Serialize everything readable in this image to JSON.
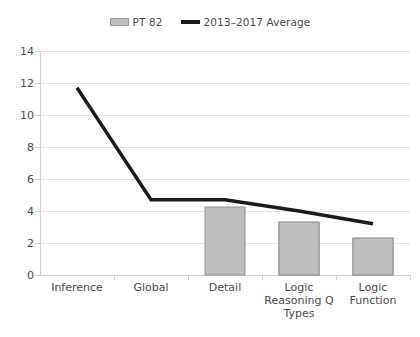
{
  "chart_data": {
    "type": "bar",
    "title": "",
    "xlabel": "",
    "ylabel": "",
    "ylim": [
      0,
      14
    ],
    "ytick_step": 2,
    "yticks": [
      "0",
      "2",
      "4",
      "6",
      "8",
      "10",
      "12",
      "14"
    ],
    "grid": true,
    "legend_position": "top-center",
    "categories": [
      "Inference",
      "Global",
      "Detail",
      "Logic Reasoning Q Types",
      "Logic Function"
    ],
    "series": [
      {
        "name": "PT 82",
        "type": "bar",
        "color": "#bebebe",
        "values": [
          12,
          6.1,
          4.25,
          3.3,
          2.3
        ]
      },
      {
        "name": "2013–2017 Average",
        "type": "line",
        "color": "#1a1a1a",
        "values": [
          11.7,
          4.7,
          4.7,
          4.0,
          3.2
        ]
      }
    ]
  },
  "legend": {
    "entries": [
      {
        "label": "PT 82",
        "marker": "bar-swatch"
      },
      {
        "label": "2013–2017 Average",
        "marker": "line-swatch"
      }
    ]
  },
  "axes": {
    "y_labels": [
      "14",
      "12",
      "10",
      "8",
      "6",
      "4",
      "2",
      "0"
    ],
    "x_labels": [
      "Inference",
      "Global",
      "Detail",
      "Logic Reasoning Q Types",
      "Logic Function"
    ]
  },
  "colors": {
    "bar_fill": "#bebebe",
    "bar_stroke": "#8f8f8f",
    "line": "#1a1a1a",
    "gridline": "#e2e2e2",
    "text": "#4a4a4a",
    "background": "#ffffff"
  }
}
